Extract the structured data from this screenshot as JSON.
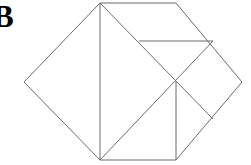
{
  "figure": {
    "label": "B",
    "label_color": "#000000",
    "background_color": "#ffffff",
    "stroke_color": "#6b6b6b",
    "stroke_width": 1,
    "fill": "none",
    "canvas": {
      "width": 251,
      "height": 165
    },
    "vertices": {
      "top_apex": [
        100,
        3
      ],
      "top_right_corner": [
        176,
        3
      ],
      "right_apex": [
        242,
        82
      ],
      "bottom_right_corner": [
        176,
        160
      ],
      "bottom_left_apex": [
        100,
        160
      ],
      "left_apex": [
        24,
        82
      ],
      "center_cross": [
        176,
        81
      ],
      "horizontal_left_end": [
        139,
        41
      ],
      "horizontal_right_end": [
        213,
        41
      ],
      "lower_right_node": [
        213,
        119
      ]
    },
    "outline_points": "100,3 176,3 242,82 176,160 100,160 24,82",
    "internal_lines": [
      {
        "name": "vertical-left-edge",
        "x1": 100,
        "y1": 3,
        "x2": 100,
        "y2": 160
      },
      {
        "name": "diagonal-top-to-lower-right",
        "x1": 100,
        "y1": 3,
        "x2": 213,
        "y2": 119
      },
      {
        "name": "diagonal-bottom-to-upper-right",
        "x1": 100,
        "y1": 160,
        "x2": 213,
        "y2": 41
      },
      {
        "name": "horizontal-upper-right",
        "x1": 139,
        "y1": 41,
        "x2": 213,
        "y2": 41
      },
      {
        "name": "vertical-center-to-bottom",
        "x1": 176,
        "y1": 81,
        "x2": 176,
        "y2": 160
      }
    ]
  }
}
